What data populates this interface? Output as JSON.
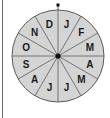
{
  "diagram": {
    "type": "month-wheel",
    "segments": [
      "J",
      "F",
      "M",
      "A",
      "M",
      "J",
      "J",
      "A",
      "S",
      "O",
      "N",
      "D"
    ],
    "colors": {
      "fill": "#d4d4d4",
      "stroke": "#5a5a5a",
      "text": "#1a1a1a",
      "center_dot": "#111111",
      "pointer_dot": "#111111"
    }
  }
}
